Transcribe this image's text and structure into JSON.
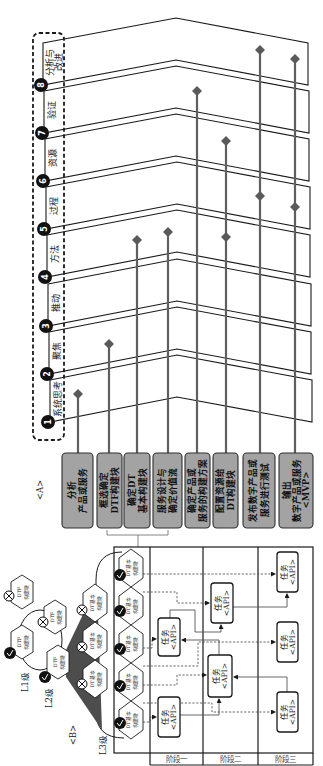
{
  "labels": {
    "a": "<A>",
    "b": "<B>"
  },
  "bands": [
    {
      "number": "1",
      "lines": [
        "系统思考"
      ]
    },
    {
      "number": "2",
      "lines": [
        "聚焦"
      ]
    },
    {
      "number": "3",
      "lines": [
        "推动"
      ]
    },
    {
      "number": "4",
      "lines": [
        "方法"
      ]
    },
    {
      "number": "5",
      "lines": [
        "过程"
      ]
    },
    {
      "number": "6",
      "lines": [
        "资源"
      ]
    },
    {
      "number": "7",
      "lines": [
        "验证"
      ]
    },
    {
      "number": "8",
      "lines": [
        "分析与",
        "改进"
      ]
    }
  ],
  "steps": [
    {
      "lines": [
        "分析",
        "产品或服务"
      ]
    },
    {
      "lines": [
        "框选确定",
        "DTF构建块"
      ]
    },
    {
      "lines": [
        "确定DT",
        "基本构建块"
      ]
    },
    {
      "lines": [
        "服务设计与",
        "确定价值流"
      ]
    },
    {
      "lines": [
        "确定产品或",
        "服务的构建方案"
      ]
    },
    {
      "lines": [
        "配置资源给",
        "DT构建块"
      ]
    },
    {
      "lines": [
        "发布数字产品或",
        "服务进行测试"
      ]
    },
    {
      "lines": [
        "输出",
        "数字产品或服务",
        "<MVP>"
      ]
    }
  ],
  "levels": {
    "l1": "L1级",
    "l2": "L2级",
    "l3": "L3级"
  },
  "blocks": {
    "dtf": [
      "DTF",
      "构建块"
    ],
    "dt": [
      "DT基本",
      "构建块"
    ]
  },
  "task": {
    "lines": [
      "任务",
      "<API>"
    ]
  },
  "stages": [
    "阶段一",
    "阶段二",
    "阶段三"
  ],
  "colors": {
    "step_box_fill": "#a3a3a3",
    "stem": "#5f5f5f",
    "cone": "#4d4d4d",
    "line": "#1a1a1a"
  }
}
